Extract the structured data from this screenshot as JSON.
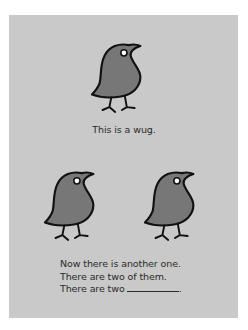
{
  "figure": {
    "background_color": "#c9c9c9",
    "bird_fill_color": "#777777",
    "panel_1": {
      "wug_count": 1,
      "caption": "This is a wug."
    },
    "panel_2": {
      "wug_count": 2,
      "lines": [
        "Now there is another one.",
        "There are two of them.",
        "There are two"
      ],
      "blank_suffix": "."
    }
  }
}
